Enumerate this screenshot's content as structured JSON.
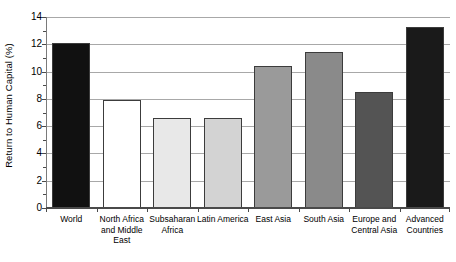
{
  "chart_data": {
    "type": "bar",
    "title": "",
    "xlabel": "",
    "ylabel": "Return to Human Capital (%)",
    "ylim": [
      0,
      14
    ],
    "yticks": [
      0,
      2,
      4,
      6,
      8,
      10,
      12,
      14
    ],
    "ytick_labels": [
      "0",
      "2",
      "4",
      "6",
      "8",
      "10",
      "12",
      "14"
    ],
    "grid": true,
    "legend": "none",
    "categories": [
      "World",
      "North Africa and Middle East",
      "Subsaharan Africa",
      "Latin America",
      "East Asia",
      "South Asia",
      "Europe and Central Asia",
      "Advanced Countries"
    ],
    "category_lines": [
      [
        "World"
      ],
      [
        "North Africa",
        "and Middle",
        "East"
      ],
      [
        "Subsaharan",
        "Africa"
      ],
      [
        "Latin America"
      ],
      [
        "East Asia"
      ],
      [
        "South Asia"
      ],
      [
        "Europe and",
        "Central Asia"
      ],
      [
        "Advanced",
        "Countries"
      ]
    ],
    "values": [
      12.1,
      7.9,
      6.6,
      6.6,
      10.4,
      11.4,
      8.5,
      13.3
    ],
    "bar_colors": [
      "#111111",
      "#ffffff",
      "#e8e8e8",
      "#d3d3d3",
      "#9a9a9a",
      "#8a8a8a",
      "#545454",
      "#1a1a1a"
    ],
    "bar_edge_color": "#3c3c3c",
    "gridline_color": "#a8a8a8",
    "axis_color": "#4a4a4a"
  }
}
